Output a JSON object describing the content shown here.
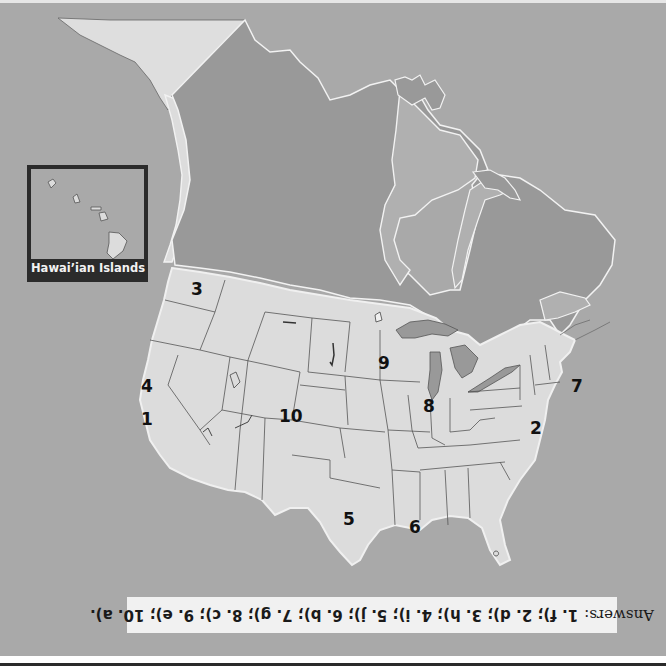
{
  "map": {
    "title": "North America regions map (United States with Canada and Alaska)",
    "colors": {
      "ocean": "#a9a9a9",
      "canada": "#999999",
      "us_land": "#dcdcdc",
      "alaska": "#dedede",
      "borders": "#555555",
      "coast_highlight": "#f2f2f2",
      "inset_frame": "#2b2b2b"
    },
    "markers": [
      {
        "number": "1",
        "region": "California coast"
      },
      {
        "number": "2",
        "region": "Chesapeake / Delaware coast"
      },
      {
        "number": "3",
        "region": "Washington / Puget Sound"
      },
      {
        "number": "4",
        "region": "Northern California coast"
      },
      {
        "number": "5",
        "region": "Texas"
      },
      {
        "number": "6",
        "region": "Louisiana / Mississippi Delta"
      },
      {
        "number": "7",
        "region": "Massachusetts / Cape Cod"
      },
      {
        "number": "8",
        "region": "Illinois / Lake Michigan"
      },
      {
        "number": "9",
        "region": "Minnesota / Wisconsin"
      },
      {
        "number": "10",
        "region": "Colorado / Rockies"
      }
    ]
  },
  "inset": {
    "label": "Hawai’ian Islands"
  },
  "answers": {
    "lead": "Answers:",
    "text": "1. f); 2. d); 3. h); 4. i); 5. j); 6. b); 7. g); 8. c); 9. e); 10. a).",
    "orientation": "rotated 180°"
  }
}
